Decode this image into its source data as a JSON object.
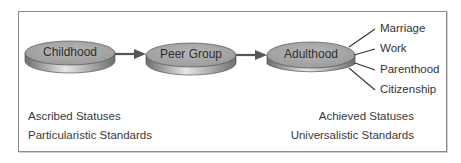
{
  "diagram": {
    "stages": [
      {
        "label": "Childhood"
      },
      {
        "label": "Peer Group"
      },
      {
        "label": "Adulthood"
      }
    ],
    "adult_roles": [
      "Marriage",
      "Work",
      "Parenthood",
      "Citizenship"
    ],
    "left_notes": [
      "Ascribed Statuses",
      "Particularistic Standards"
    ],
    "right_notes": [
      "Achieved Statuses",
      "Universalistic Standards"
    ],
    "colors": {
      "disc_top": "#a8a8a8",
      "disc_side": "#8c8c8c",
      "arrow": "#555555",
      "border": "#8a8a8a"
    }
  }
}
